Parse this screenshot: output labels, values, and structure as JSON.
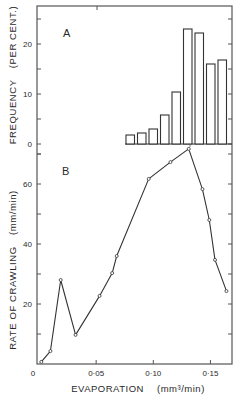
{
  "figure": {
    "panel_a_label": "A",
    "panel_b_label": "B",
    "frame_color": "#555555",
    "line_color": "#333333",
    "background": "#ffffff"
  },
  "chart_data": [
    {
      "panel": "A",
      "type": "bar",
      "title": "",
      "xlabel": "",
      "ylabel": "FREQUENCY (PER CENT.)",
      "ylabel_main": "FREQUENCY",
      "ylabel_unit": "(PER CENT.)",
      "ylim": [
        -2,
        27.5
      ],
      "yticks": [
        0,
        10,
        20
      ],
      "yticks_minor": [
        5,
        15,
        25
      ],
      "bar_style": "outline",
      "categories": [
        1,
        2,
        3,
        4,
        5,
        6,
        7,
        8,
        9
      ],
      "values": [
        1.8,
        2.2,
        3.0,
        5.8,
        10.4,
        23.0,
        22.2,
        16.0,
        16.8
      ],
      "grid": false,
      "legend": null
    },
    {
      "panel": "B",
      "type": "line",
      "title": "",
      "xlabel": "EVAPORATION (mm³/min)",
      "xlabel_main": "EVAPORATION",
      "xlabel_unit": "(mm³/min)",
      "ylabel": "RATE OF CRAWLING (mm/min)",
      "ylabel_main": "RATE OF CRAWLING",
      "ylabel_unit": "(mm/min)",
      "xlim": [
        0,
        0.168
      ],
      "ylim": [
        0,
        73
      ],
      "xticks": [
        0,
        0.05,
        0.1,
        0.15
      ],
      "xtick_labels": [
        "0",
        "0·05",
        "0·10",
        "0·15"
      ],
      "yticks": [
        20,
        40,
        60
      ],
      "yticks_minor": [
        10,
        30,
        50,
        70
      ],
      "marker": "open-circle",
      "x": [
        0.002,
        0.01,
        0.019,
        0.032,
        0.053,
        0.064,
        0.068,
        0.096,
        0.115,
        0.131,
        0.143,
        0.149,
        0.154,
        0.164
      ],
      "y": [
        0.7,
        4.3,
        28.0,
        9.7,
        22.7,
        30.3,
        36.0,
        61.7,
        67.3,
        71.7,
        58.3,
        48.0,
        34.7,
        24.3
      ],
      "grid": false,
      "legend": null
    }
  ]
}
